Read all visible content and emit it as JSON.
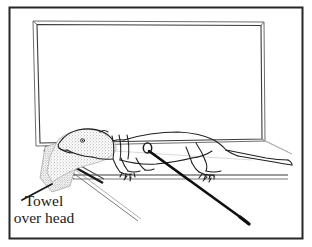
{
  "figure": {
    "kind": "line-drawing-illustration",
    "background_color": "#ffffff",
    "ink_color": "#1a1a1a",
    "border": {
      "present": true,
      "color": "#262626",
      "width_px": 2
    },
    "annotations": [
      {
        "id": "towel-over-head",
        "line1": "Towel",
        "line2": "over head",
        "x": 44,
        "y": 206,
        "leader_line": {
          "from_x": 22,
          "from_y": 200,
          "to_x": 52,
          "to_y": 184
        }
      }
    ],
    "elements": {
      "backdrop_panel_label": "backdrop panel",
      "table_label": "examination table",
      "animal_label": "ferret",
      "towel_label": "towel",
      "needle_label": "hypodermic needle",
      "injection_site_label": "injection site"
    },
    "colors": {
      "ink": "#1a1a1a",
      "line_gray": "#555555",
      "stipple": "#6b6b6b",
      "paper": "#ffffff",
      "border": "#262626"
    }
  }
}
